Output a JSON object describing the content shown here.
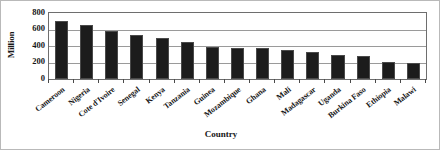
{
  "chart_data": {
    "type": "bar",
    "title": "",
    "xlabel": "Country",
    "ylabel": "Million",
    "categories": [
      "Cameroon",
      "Nigeria",
      "Cote d'Ivoire",
      "Senegal",
      "Kenya",
      "Tanzania",
      "Guinea",
      "Mozambique",
      "Ghana",
      "Mali",
      "Madagascar",
      "Uganda",
      "Burkina Faso",
      "Ethiopia",
      "Malawi"
    ],
    "values": [
      700,
      655,
      580,
      535,
      495,
      450,
      385,
      380,
      370,
      355,
      330,
      290,
      285,
      205,
      200
    ],
    "ylim": [
      0,
      800
    ],
    "yticks": [
      0,
      200,
      400,
      600,
      800
    ],
    "ytick_labels": [
      "0",
      "200",
      "400",
      "600",
      "800"
    ],
    "grid": true,
    "grid_axis": "y",
    "legend": false,
    "bar_color": "#1c1c1c",
    "bar_edge_color": "#4a4a4a",
    "frame_color": "#6e6e6e",
    "gridline_color": "#9a9a9a",
    "background_color": "#ffffff"
  }
}
